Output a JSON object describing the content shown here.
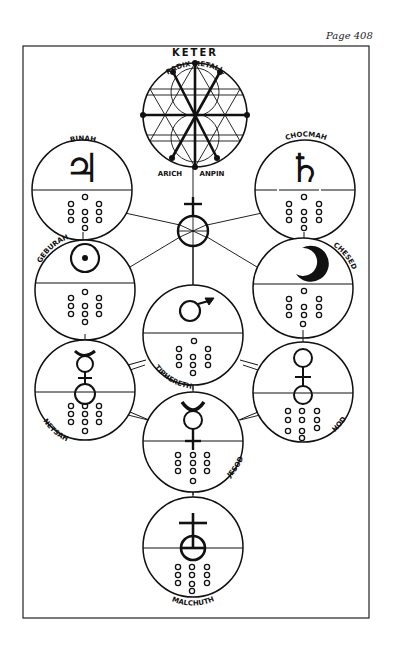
{
  "page": {
    "number_label": "Page 408"
  },
  "diagram": {
    "keter": {
      "label": "KETER",
      "upper_arc": "RADIX METALL.",
      "lower_arc_left": "ARICH",
      "lower_arc_right": "ANPIN"
    },
    "sephiroth": [
      {
        "name": "BINAH",
        "symbol": "jupiter-symbol",
        "glyph": "♃",
        "dots": 10
      },
      {
        "name": "CHOCMAH",
        "symbol": "saturn-symbol",
        "glyph": "♄",
        "dots": 10
      },
      {
        "name": "GEBURAH",
        "symbol": "sun-symbol",
        "glyph": "☉",
        "dots": 10
      },
      {
        "name": "CHESED",
        "symbol": "moon-symbol",
        "glyph": "☽",
        "dots": 10
      },
      {
        "name": "TIPHERETH",
        "symbol": "mars-symbol",
        "glyph": "♂",
        "dots": 10
      },
      {
        "name": "NETSAH",
        "symbol": "mercury-venus-symbol",
        "glyph": "☿",
        "dots": 10
      },
      {
        "name": "HOD",
        "symbol": "venus-symbol",
        "glyph": "♀",
        "dots": 10
      },
      {
        "name": "JESOD",
        "symbol": "mercury-symbol",
        "glyph": "☿",
        "dots": 10
      },
      {
        "name": "MALCHUTH",
        "symbol": "earth-antimony-symbol",
        "glyph": "♁",
        "dots": 10
      }
    ],
    "central_node": {
      "symbol": "antimony-earth-symbol",
      "glyph": "♁"
    },
    "labels": {
      "binah": "BINAH",
      "chocmah": "CHOCMAH",
      "geburah": "GEBURAH",
      "chesed": "CHESED",
      "tiphereth": "TIPHERETH",
      "netsah": "NETSAH",
      "hod": "HOD",
      "jesod": "JESOD",
      "malchuth": "MALCHUTH"
    }
  }
}
